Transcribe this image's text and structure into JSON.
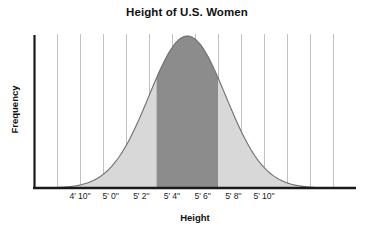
{
  "chart_data": {
    "type": "area",
    "title": "Height of U.S. Women",
    "xlabel": "Height",
    "ylabel": "Frequency",
    "grid": true,
    "legend": "none",
    "distribution": "normal",
    "mean_label": "5' 5''",
    "mean_inches": 65,
    "std_dev_inches": 2.5,
    "xlim_inches": [
      55,
      76
    ],
    "ylim": [
      0,
      1
    ],
    "tick_labels": [
      "4' 10''",
      "5' 0''",
      "5' 2''",
      "5' 4''",
      "5' 6''",
      "5' 8''",
      "5' 10''"
    ],
    "tick_values_inches": [
      58,
      60,
      62,
      64,
      66,
      68,
      70
    ],
    "x": [
      55,
      56,
      57,
      58,
      59,
      60,
      61,
      62,
      63,
      64,
      65,
      66,
      67,
      68,
      69,
      70,
      71,
      72,
      73,
      74,
      75,
      76
    ],
    "values": [
      0.0,
      0.01,
      0.02,
      0.04,
      0.08,
      0.14,
      0.23,
      0.35,
      0.53,
      0.73,
      0.92,
      1.0,
      0.92,
      0.73,
      0.53,
      0.35,
      0.23,
      0.14,
      0.08,
      0.04,
      0.02,
      0.01
    ],
    "shaded_region": {
      "label": "central shaded band",
      "from_inches": 63,
      "to_inches": 67,
      "from_label": "5' 3''",
      "to_label": "5' 7''",
      "fill_color": "#8c8c8c"
    },
    "curve_fill_color": "#d8d8d8",
    "curve_line_color": "#6e6e6e",
    "gridline_color": "#b9b9b9",
    "axis_color": "#1a1a1a",
    "gridline_count": 13
  }
}
